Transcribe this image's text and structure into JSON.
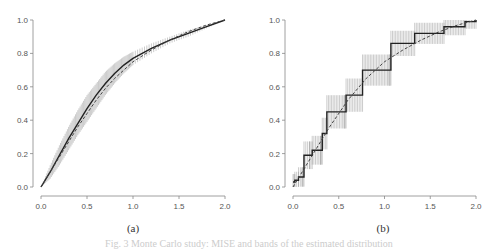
{
  "chart_data": [
    {
      "type": "line",
      "label": "(a)",
      "xlim": [
        0,
        2
      ],
      "ylim": [
        0,
        1
      ],
      "xticks": [
        "0.0",
        "0.5",
        "1.0",
        "1.5",
        "2.0"
      ],
      "yticks": [
        "0.0",
        "0.2",
        "0.4",
        "0.6",
        "0.8",
        "1.0"
      ],
      "series": [
        {
          "name": "estimate",
          "style": "solid",
          "x": [
            0,
            0.1,
            0.2,
            0.3,
            0.4,
            0.5,
            0.6,
            0.7,
            0.8,
            0.9,
            1.0,
            1.2,
            1.4,
            1.6,
            1.8,
            2.0
          ],
          "y": [
            0,
            0.09,
            0.19,
            0.29,
            0.38,
            0.47,
            0.55,
            0.62,
            0.68,
            0.73,
            0.77,
            0.83,
            0.88,
            0.92,
            0.96,
            1.0
          ]
        },
        {
          "name": "true",
          "style": "dashed",
          "x": [
            0,
            0.1,
            0.2,
            0.3,
            0.4,
            0.5,
            0.6,
            0.7,
            0.8,
            0.9,
            1.0,
            1.2,
            1.4,
            1.6,
            1.8,
            2.0
          ],
          "y": [
            0,
            0.09,
            0.18,
            0.27,
            0.36,
            0.44,
            0.52,
            0.59,
            0.65,
            0.7,
            0.75,
            0.82,
            0.88,
            0.93,
            0.97,
            1.0
          ]
        },
        {
          "name": "band_upper",
          "y": [
            0,
            0.13,
            0.25,
            0.36,
            0.46,
            0.55,
            0.62,
            0.69,
            0.74,
            0.78,
            0.81,
            0.86,
            0.9,
            0.94,
            0.97,
            1.0
          ]
        },
        {
          "name": "band_lower",
          "y": [
            0,
            0.05,
            0.13,
            0.22,
            0.31,
            0.39,
            0.47,
            0.55,
            0.62,
            0.68,
            0.73,
            0.8,
            0.86,
            0.9,
            0.95,
            1.0
          ]
        }
      ]
    },
    {
      "type": "line",
      "label": "(b)",
      "xlim": [
        0,
        2
      ],
      "ylim": [
        0,
        1
      ],
      "xticks": [
        "0.0",
        "0.5",
        "1.0",
        "1.5",
        "2.0"
      ],
      "yticks": [
        "0.0",
        "0.2",
        "0.4",
        "0.6",
        "0.8",
        "1.0"
      ],
      "series": [
        {
          "name": "step_estimate",
          "style": "step",
          "x": [
            0,
            0.02,
            0.06,
            0.1,
            0.12,
            0.18,
            0.21,
            0.3,
            0.32,
            0.37,
            0.56,
            0.58,
            0.76,
            1.05,
            1.07,
            1.33,
            1.65,
            1.88,
            2.0
          ],
          "y": [
            0.03,
            0.04,
            0.06,
            0.06,
            0.19,
            0.19,
            0.22,
            0.22,
            0.32,
            0.45,
            0.45,
            0.55,
            0.7,
            0.7,
            0.86,
            0.92,
            0.96,
            0.99,
            1.0
          ]
        },
        {
          "name": "true",
          "style": "dashed",
          "x": [
            0,
            0.2,
            0.4,
            0.6,
            0.8,
            1.0,
            1.2,
            1.4,
            1.6,
            1.8,
            2.0
          ],
          "y": [
            0,
            0.18,
            0.36,
            0.52,
            0.65,
            0.75,
            0.82,
            0.88,
            0.93,
            0.97,
            1.0
          ]
        }
      ]
    }
  ],
  "labels": {
    "a": "(a)",
    "b": "(b)"
  },
  "caption": "Fig. 3  Monte Carlo study: MISE and bands of the estimated distribution"
}
